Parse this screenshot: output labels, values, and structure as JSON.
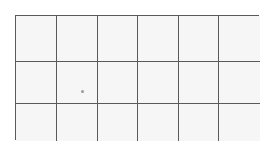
{
  "grid": {
    "columns": 6,
    "rows": 3,
    "line_color": "#5a5a5a",
    "cell_fill": "#f6f6f6",
    "background": "#ffffff"
  },
  "markers": [
    {
      "kind": "dot",
      "row": 2,
      "col": 2,
      "x": 82,
      "y": 91,
      "color": "#9a9a9a"
    }
  ]
}
